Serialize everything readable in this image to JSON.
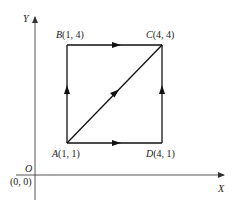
{
  "diagram": {
    "axes": {
      "x_label": "X",
      "y_label": "Y",
      "origin_label": "O",
      "origin_coords": "(0, 0)"
    },
    "points": [
      {
        "id": "A",
        "label": "A(1, 1)",
        "x": 1,
        "y": 1
      },
      {
        "id": "B",
        "label": "B(1, 4)",
        "x": 1,
        "y": 4
      },
      {
        "id": "C",
        "label": "C(4, 4)",
        "x": 4,
        "y": 4
      },
      {
        "id": "D",
        "label": "D(4, 1)",
        "x": 4,
        "y": 1
      }
    ],
    "paths": [
      {
        "from": "A",
        "to": "B",
        "direction": "up"
      },
      {
        "from": "B",
        "to": "C",
        "direction": "right"
      },
      {
        "from": "A",
        "to": "D",
        "direction": "right"
      },
      {
        "from": "D",
        "to": "C",
        "direction": "up"
      },
      {
        "from": "A",
        "to": "C",
        "direction": "diagonal"
      }
    ],
    "colors": {
      "line": "#111111",
      "axis": "#555555",
      "background": "#ffffff"
    }
  }
}
